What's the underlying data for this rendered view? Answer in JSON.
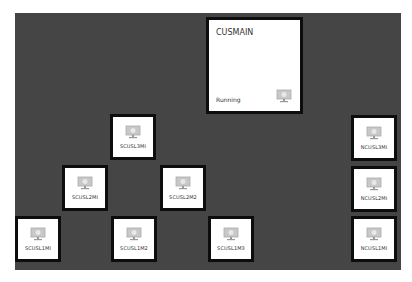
{
  "main_vm": {
    "name": "CUSMAIN",
    "status": "Running",
    "icon": "monitor-icon"
  },
  "vms": [
    {
      "name": "SCUSL3MI",
      "icon": "monitor-icon",
      "x": 110,
      "y": 114
    },
    {
      "name": "SCUSL2MI",
      "icon": "monitor-icon",
      "x": 62,
      "y": 165
    },
    {
      "name": "SCUSL2M2",
      "icon": "monitor-icon",
      "x": 160,
      "y": 165
    },
    {
      "name": "SCUSL1MI",
      "icon": "monitor-icon",
      "x": 15,
      "y": 216
    },
    {
      "name": "SCUSL1M2",
      "icon": "monitor-icon",
      "x": 111,
      "y": 216
    },
    {
      "name": "SCUSL1M3",
      "icon": "monitor-icon",
      "x": 208,
      "y": 216
    },
    {
      "name": "NCUSL3MI",
      "icon": "monitor-icon",
      "x": 351,
      "y": 115
    },
    {
      "name": "NCUSL2MI",
      "icon": "monitor-icon",
      "x": 351,
      "y": 166
    },
    {
      "name": "NCUSL1MI",
      "icon": "monitor-icon",
      "x": 351,
      "y": 216
    }
  ],
  "colors": {
    "canvas": "#454545",
    "tile_border": "#0d0d0d",
    "tile_bg": "#ffffff"
  }
}
